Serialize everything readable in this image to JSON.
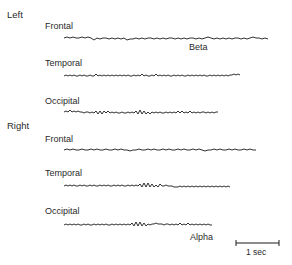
{
  "groups": [
    {
      "label": "Left",
      "channels": [
        {
          "label": "Frontal",
          "band": "Beta"
        },
        {
          "label": "Temporal"
        },
        {
          "label": "Occipital"
        }
      ]
    },
    {
      "label": "Right",
      "channels": [
        {
          "label": "Frontal"
        },
        {
          "label": "Temporal"
        },
        {
          "label": "Occipital",
          "band": "Alpha"
        }
      ]
    }
  ],
  "scale_bar": {
    "label": "1 sec"
  },
  "colors": {
    "trace": "#1a1a1a",
    "text": "#2a2a2a"
  }
}
